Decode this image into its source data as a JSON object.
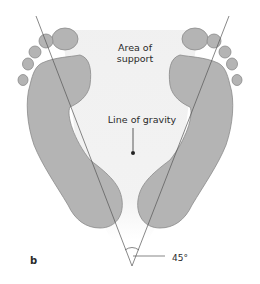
{
  "figure": {
    "panel_label": "b",
    "labels": {
      "area_of_support": "Area of\nsupport",
      "line_of_gravity": "Line of gravity",
      "angle": "45°"
    },
    "colors": {
      "foot_fill": "#b4b4b4",
      "foot_stroke": "#8a8a8a",
      "support_area": "#ececec",
      "lines": "#555555",
      "text": "#2a2a2a"
    },
    "angle_degrees": 45
  }
}
